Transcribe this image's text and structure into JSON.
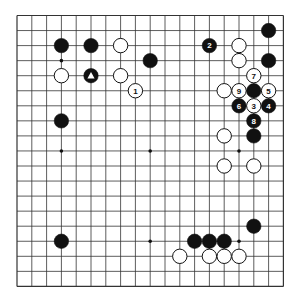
{
  "board": {
    "size": 19,
    "origin_x": 17,
    "origin_y": 15.5,
    "spacing_x": 14.8,
    "spacing_y": 15.05,
    "line_color": "#333333",
    "background": "#ffffff",
    "star_points": [
      [
        3,
        3
      ],
      [
        9,
        3
      ],
      [
        15,
        3
      ],
      [
        3,
        9
      ],
      [
        9,
        9
      ],
      [
        15,
        9
      ],
      [
        3,
        15
      ],
      [
        9,
        15
      ],
      [
        15,
        15
      ]
    ]
  },
  "stones": [
    {
      "color": "black",
      "col": 3,
      "row": 2,
      "label": ""
    },
    {
      "color": "black",
      "col": 5,
      "row": 2,
      "label": ""
    },
    {
      "color": "white",
      "col": 7,
      "row": 2,
      "label": ""
    },
    {
      "color": "black",
      "col": 9,
      "row": 3,
      "label": ""
    },
    {
      "color": "white",
      "col": 3,
      "row": 4,
      "label": ""
    },
    {
      "color": "black",
      "col": 5,
      "row": 4,
      "label": "",
      "marker": "triangle"
    },
    {
      "color": "white",
      "col": 7,
      "row": 4,
      "label": ""
    },
    {
      "color": "white",
      "col": 8,
      "row": 5,
      "label": "1"
    },
    {
      "color": "black",
      "col": 3,
      "row": 7,
      "label": ""
    },
    {
      "color": "black",
      "col": 17,
      "row": 1,
      "label": ""
    },
    {
      "color": "black",
      "col": 13,
      "row": 2,
      "label": "2"
    },
    {
      "color": "white",
      "col": 15,
      "row": 2,
      "label": ""
    },
    {
      "color": "white",
      "col": 15,
      "row": 3,
      "label": ""
    },
    {
      "color": "black",
      "col": 17,
      "row": 3,
      "label": ""
    },
    {
      "color": "white",
      "col": 16,
      "row": 4,
      "label": "7"
    },
    {
      "color": "white",
      "col": 14,
      "row": 5,
      "label": ""
    },
    {
      "color": "white",
      "col": 15,
      "row": 5,
      "label": "9"
    },
    {
      "color": "black",
      "col": 16,
      "row": 5,
      "label": ""
    },
    {
      "color": "white",
      "col": 17,
      "row": 5,
      "label": "5"
    },
    {
      "color": "black",
      "col": 15,
      "row": 6,
      "label": "6"
    },
    {
      "color": "white",
      "col": 16,
      "row": 6,
      "label": "3"
    },
    {
      "color": "black",
      "col": 17,
      "row": 6,
      "label": "4"
    },
    {
      "color": "black",
      "col": 16,
      "row": 7,
      "label": "8"
    },
    {
      "color": "white",
      "col": 14,
      "row": 8,
      "label": ""
    },
    {
      "color": "black",
      "col": 16,
      "row": 8,
      "label": ""
    },
    {
      "color": "white",
      "col": 14,
      "row": 10,
      "label": ""
    },
    {
      "color": "white",
      "col": 16,
      "row": 10,
      "label": ""
    },
    {
      "color": "black",
      "col": 16,
      "row": 14,
      "label": ""
    },
    {
      "color": "black",
      "col": 3,
      "row": 15,
      "label": ""
    },
    {
      "color": "black",
      "col": 12,
      "row": 15,
      "label": ""
    },
    {
      "color": "black",
      "col": 13,
      "row": 15,
      "label": ""
    },
    {
      "color": "black",
      "col": 14,
      "row": 15,
      "label": ""
    },
    {
      "color": "white",
      "col": 11,
      "row": 16,
      "label": ""
    },
    {
      "color": "white",
      "col": 13,
      "row": 16,
      "label": ""
    },
    {
      "color": "white",
      "col": 14,
      "row": 16,
      "label": ""
    },
    {
      "color": "white",
      "col": 15,
      "row": 16,
      "label": ""
    }
  ]
}
